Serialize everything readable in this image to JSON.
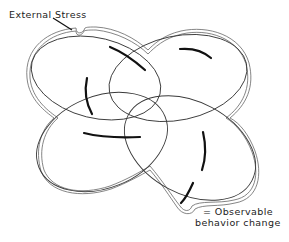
{
  "diagram": {
    "title": "",
    "labels": {
      "external_stress": "External Stress",
      "observable_line1": "= Observable",
      "observable_line2": "behavior change"
    },
    "nodes": [
      {
        "id": "ellipse-top-left",
        "shape": "ellipse"
      },
      {
        "id": "ellipse-top-right",
        "shape": "ellipse"
      },
      {
        "id": "ellipse-bottom-left",
        "shape": "ellipse"
      },
      {
        "id": "ellipse-bottom-right",
        "shape": "ellipse"
      }
    ],
    "annotations": [
      {
        "id": "external-stress-pointer",
        "target": "outer-boundary-dent-top-left"
      },
      {
        "id": "observable-behavior-pointer",
        "target": "outer-boundary-dent-bottom-right"
      }
    ],
    "behavior_arrows_count": 6,
    "colors": {
      "ellipse_stroke": "#3a3a3a",
      "outer_boundary": "#555555",
      "behavior_arrow": "#111111",
      "background": "#ffffff"
    }
  }
}
